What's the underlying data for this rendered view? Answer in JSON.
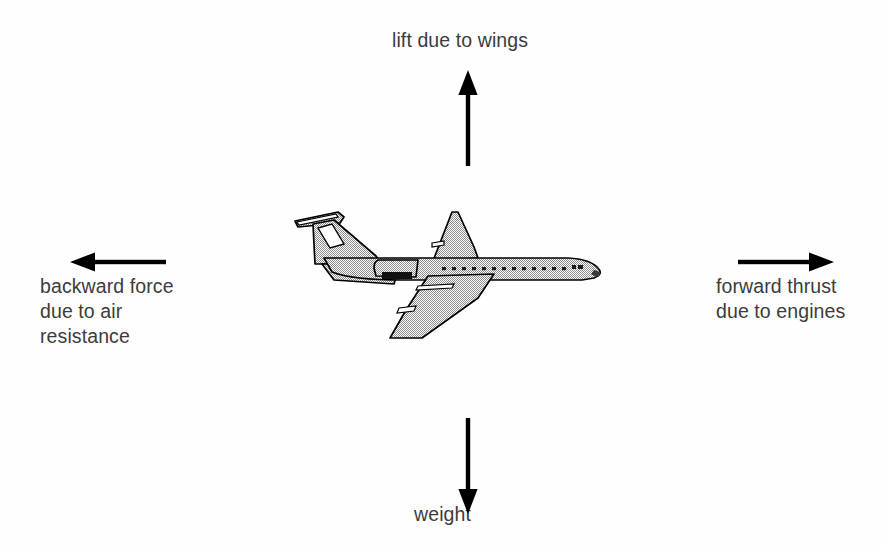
{
  "diagram": {
    "background_color": "#fefefe",
    "ink_color": "#000000",
    "text_color": "#3c3c3c"
  },
  "labels": {
    "lift": "lift due to wings",
    "weight": "weight",
    "backward": "backward force\ndue to air\nresistance",
    "forward": "forward thrust\ndue to engines"
  },
  "arrows": [
    {
      "name": "lift-arrow",
      "direction": "up",
      "label_ref": "lift"
    },
    {
      "name": "weight-arrow",
      "direction": "down",
      "label_ref": "weight"
    },
    {
      "name": "drag-arrow",
      "direction": "left",
      "label_ref": "backward"
    },
    {
      "name": "thrust-arrow",
      "direction": "right",
      "label_ref": "forward"
    }
  ],
  "illustration": {
    "name": "airliner-illustration",
    "description": "Side view line drawing of a T-tail jet airliner facing right with halftone shading",
    "fill": "#c9c9c9",
    "outline": "#000000"
  }
}
